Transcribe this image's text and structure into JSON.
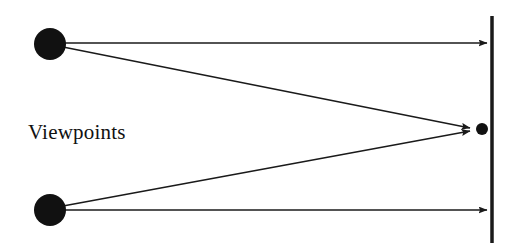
{
  "diagram": {
    "background_color": "#ffffff",
    "stroke_color": "#1a1a1a",
    "fill_color": "#111111",
    "width": 520,
    "height": 250
  },
  "labels": {
    "viewpoints": "Viewpoints"
  },
  "nodes": {
    "viewpoint_top": {
      "name": "viewpoint-top",
      "shape": "filled-circle",
      "cx": 50,
      "cy": 44,
      "r": 16
    },
    "viewpoint_bottom": {
      "name": "viewpoint-bottom",
      "shape": "filled-circle",
      "cx": 50,
      "cy": 210,
      "r": 16
    },
    "target_point": {
      "name": "target-point",
      "shape": "filled-circle",
      "cx": 482,
      "cy": 129,
      "r": 6
    }
  },
  "surface": {
    "name": "projection-plane",
    "x": 492,
    "y_top": 16,
    "y_bottom": 243,
    "thickness": 3.5
  },
  "arrows": [
    {
      "name": "ray-top-horizontal",
      "x1": 64,
      "y1": 43,
      "x2": 487,
      "y2": 43,
      "arrowhead": true
    },
    {
      "name": "ray-top-to-target",
      "x1": 63,
      "y1": 47,
      "x2": 470,
      "y2": 128,
      "arrowhead": true
    },
    {
      "name": "ray-bottom-to-target",
      "x1": 63,
      "y1": 206,
      "x2": 470,
      "y2": 131,
      "arrowhead": true
    },
    {
      "name": "ray-bottom-horizontal",
      "x1": 64,
      "y1": 210,
      "x2": 487,
      "y2": 210,
      "arrowhead": true
    }
  ],
  "text_position": {
    "viewpoints_x": 28,
    "viewpoints_y": 139
  }
}
